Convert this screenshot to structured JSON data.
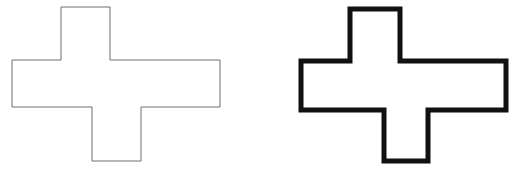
{
  "canvas": {
    "width": 523,
    "height": 173,
    "background_color": "#ffffff"
  },
  "figure": {
    "title": "",
    "caption": "",
    "shape_count": 2
  },
  "shapes": [
    {
      "name": "cross-outline-thin",
      "label": "",
      "kind": "cross-polygon",
      "stroke_color": "#6e6e6e",
      "stroke_width": 1,
      "fill_color": "#ffffff",
      "points": "61,7 110,7 110,60 220,60 220,107 141,107 141,161 92,161 92,107 12,107 12,60 61,60",
      "bounds": {
        "x": 12,
        "y": 7,
        "width": 208,
        "height": 154
      }
    },
    {
      "name": "cross-outline-thick",
      "label": "",
      "kind": "cross-polygon",
      "stroke_color": "#111111",
      "stroke_width": 5,
      "fill_color": "#ffffff",
      "points": "350,9 400,9 400,61 506,61 506,110 428,110 428,161 384,161 384,110 301,110 301,61 350,61",
      "bounds": {
        "x": 299,
        "y": 7,
        "width": 209,
        "height": 156
      }
    }
  ],
  "chart_data": {
    "type": "table",
    "title": "",
    "categories": [
      "thin-stroke cross",
      "thick-stroke cross"
    ],
    "values": [
      1,
      5
    ],
    "xlabel": "",
    "ylabel": "stroke width (px)"
  }
}
